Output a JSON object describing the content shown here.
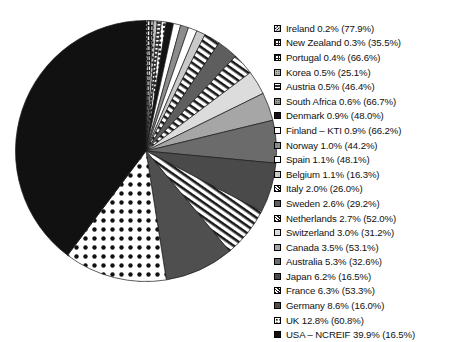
{
  "chart_data": {
    "type": "pie",
    "title": "",
    "xlabel": "",
    "ylabel": "",
    "legend_position": "right",
    "start_angle_deg": 0,
    "direction": "clockwise",
    "categories": [
      "Ireland",
      "New Zealand",
      "Portugal",
      "Korea",
      "Austria",
      "South Africa",
      "Denmark",
      "Finland – KTI",
      "Norway",
      "Spain",
      "Belgium",
      "Italy",
      "Sweden",
      "Netherlands",
      "Switzerland",
      "Canada",
      "Australia",
      "Japan",
      "France",
      "Germany",
      "UK",
      "USA – NCREIF"
    ],
    "values": [
      0.2,
      0.3,
      0.4,
      0.5,
      0.5,
      0.6,
      0.9,
      0.9,
      1.0,
      1.1,
      1.1,
      2.0,
      2.6,
      2.7,
      3.0,
      3.5,
      5.3,
      6.2,
      6.3,
      8.6,
      12.8,
      39.9
    ],
    "secondary_values": [
      77.9,
      35.5,
      66.6,
      25.1,
      46.4,
      66.7,
      48.0,
      66.2,
      44.2,
      48.1,
      16.3,
      26.0,
      29.2,
      52.0,
      31.2,
      53.1,
      32.6,
      16.5,
      53.3,
      16.0,
      60.8,
      16.5
    ],
    "value_unit": "%",
    "secondary_unit": "%"
  },
  "legend": {
    "items": [
      {
        "label": "Ireland  0.2% (77.9%)",
        "name": "Ireland",
        "value": 0.2,
        "secondary": 77.9,
        "pattern": "checker-dense",
        "fill": "#ffffff",
        "ink": "#1a1a1a"
      },
      {
        "label": "New Zealand  0.3% (35.5%)",
        "name": "New Zealand",
        "value": 0.3,
        "secondary": 35.5,
        "pattern": "grid-light",
        "fill": "#ffffff",
        "ink": "#1a1a1a"
      },
      {
        "label": "Portugal  0.4% (66.6%)",
        "name": "Portugal",
        "value": 0.4,
        "secondary": 66.6,
        "pattern": "grid-light",
        "fill": "#ffffff",
        "ink": "#1a1a1a"
      },
      {
        "label": "Korea  0.5% (25.1%)",
        "name": "Korea",
        "value": 0.5,
        "secondary": 25.1,
        "pattern": "dots-grey",
        "fill": "#b8b8b8",
        "ink": "#1a1a1a"
      },
      {
        "label": "Austria  0.5% (46.4%)",
        "name": "Austria",
        "value": 0.5,
        "secondary": 46.4,
        "pattern": "half-solid",
        "fill": "#333333",
        "ink": "#1a1a1a"
      },
      {
        "label": "South Africa  0.6% (66.7%)",
        "name": "South Africa",
        "value": 0.6,
        "secondary": 66.7,
        "pattern": "dots-dense",
        "fill": "#9a9a9a",
        "ink": "#1a1a1a"
      },
      {
        "label": "Denmark  0.9% (48.0%)",
        "name": "Denmark",
        "value": 0.9,
        "secondary": 48.0,
        "pattern": "solid-black",
        "fill": "#141414",
        "ink": "#141414"
      },
      {
        "label": "Finland – KTI  0.9% (66.2%)",
        "name": "Finland – KTI",
        "value": 0.9,
        "secondary": 66.2,
        "pattern": "open-white",
        "fill": "#ffffff",
        "ink": "#1a1a1a"
      },
      {
        "label": "Norway  1.0% (44.2%)",
        "name": "Norway",
        "value": 1.0,
        "secondary": 44.2,
        "pattern": "grey-mid",
        "fill": "#8c8c8c",
        "ink": "#1a1a1a"
      },
      {
        "label": "Spain  1.1% (48.1%)",
        "name": "Spain",
        "value": 1.1,
        "secondary": 48.1,
        "pattern": "open-white",
        "fill": "#ffffff",
        "ink": "#1a1a1a"
      },
      {
        "label": "Belgium  1.1% (16.3%)",
        "name": "Belgium",
        "value": 1.1,
        "secondary": 16.3,
        "pattern": "grey-light",
        "fill": "#c9c9c9",
        "ink": "#1a1a1a"
      },
      {
        "label": "Italy  2.0% (26.0%)",
        "name": "Italy",
        "value": 2.0,
        "secondary": 26.0,
        "pattern": "diag-hatch",
        "fill": "#ffffff",
        "ink": "#1a1a1a"
      },
      {
        "label": "Sweden  2.6% (29.2%)",
        "name": "Sweden",
        "value": 2.6,
        "secondary": 29.2,
        "pattern": "grey-dark",
        "fill": "#5e5e5e",
        "ink": "#1a1a1a"
      },
      {
        "label": "Netherlands  2.7% (52.0%)",
        "name": "Netherlands",
        "value": 2.7,
        "secondary": 52.0,
        "pattern": "diag-hatch",
        "fill": "#ffffff",
        "ink": "#1a1a1a"
      },
      {
        "label": "Switzerland  3.0% (31.2%)",
        "name": "Switzerland",
        "value": 3.0,
        "secondary": 31.2,
        "pattern": "grey-pale",
        "fill": "#dcdcdc",
        "ink": "#1a1a1a"
      },
      {
        "label": "Canada  3.5% (53.1%)",
        "name": "Canada",
        "value": 3.5,
        "secondary": 53.1,
        "pattern": "grey-mid",
        "fill": "#a6a6a6",
        "ink": "#1a1a1a"
      },
      {
        "label": "Australia  5.3% (32.6%)",
        "name": "Australia",
        "value": 5.3,
        "secondary": 32.6,
        "pattern": "grey-dark",
        "fill": "#6b6b6b",
        "ink": "#1a1a1a"
      },
      {
        "label": "Japan  6.2% (16.5%)",
        "name": "Japan",
        "value": 6.2,
        "secondary": 16.5,
        "pattern": "grey-darker",
        "fill": "#4a4a4a",
        "ink": "#1a1a1a"
      },
      {
        "label": "France  6.3% (53.3%)",
        "name": "France",
        "value": 6.3,
        "secondary": 53.3,
        "pattern": "diag-hatch",
        "fill": "#ffffff",
        "ink": "#1a1a1a"
      },
      {
        "label": "Germany  8.6% (16.0%)",
        "name": "Germany",
        "value": 8.6,
        "secondary": 16.0,
        "pattern": "grey-darker",
        "fill": "#4f4f4f",
        "ink": "#1a1a1a"
      },
      {
        "label": "UK  12.8% (60.8%)",
        "name": "UK",
        "value": 12.8,
        "secondary": 60.8,
        "pattern": "dots-bold",
        "fill": "#ffffff",
        "ink": "#1a1a1a"
      },
      {
        "label": "USA – NCREIF  39.9% (16.5%)",
        "name": "USA – NCREIF",
        "value": 39.9,
        "secondary": 16.5,
        "pattern": "solid-black",
        "fill": "#111111",
        "ink": "#111111"
      }
    ]
  },
  "caption": {
    "text": ""
  }
}
